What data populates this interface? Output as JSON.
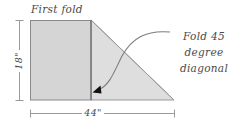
{
  "diagram": {
    "title_label": "First fold",
    "callout": {
      "lines": [
        "Fold 45",
        "degree",
        "diagonal"
      ]
    },
    "dimensions": {
      "height_label": "18\"",
      "width_label": "44\""
    },
    "colors": {
      "rectangle_fill": "#d5d5d5",
      "triangle_fill": "#dedede",
      "outline": "#8a8a8a",
      "fold_line": "#6e6e6e",
      "dimension_line": "#9a9a9a",
      "text": "#4a4a4a",
      "arrow": "#111111",
      "background": "#ffffff"
    },
    "shapes": {
      "rectangle_name": "folded-panel-rectangle",
      "triangle_name": "diagonal-fold-triangle",
      "fold_line_name": "first-fold-line",
      "arrow_name": "callout-arrow"
    }
  }
}
